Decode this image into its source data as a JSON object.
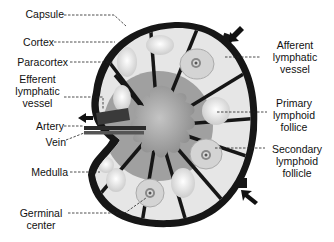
{
  "diagram": {
    "labels": {
      "capsule": "Capsule",
      "cortex": "Cortex",
      "paracortex": "Paracortex",
      "efferent_line1": "Efferent",
      "efferent_line2": "lymphatic",
      "efferent_line3": "vessel",
      "artery": "Artery",
      "vein": "Vein",
      "medulla": "Medulla",
      "germinal_line1": "Germinal",
      "germinal_line2": "center",
      "afferent_line1": "Afferent",
      "afferent_line2": "lymphatic",
      "afferent_line3": "vessel",
      "primary_line1": "Primary",
      "primary_line2": "lymphoid",
      "primary_line3": "follice",
      "secondary_line1": "Secondary",
      "secondary_line2": "lymphoid",
      "secondary_line3": "follicle"
    },
    "colors": {
      "capsule": "#1a1a1a",
      "cortex": "#e8e8e8",
      "paracortex": "#9a9a9a",
      "medulla": "#a8a8a8",
      "follicle": "#d8d8d8"
    }
  }
}
